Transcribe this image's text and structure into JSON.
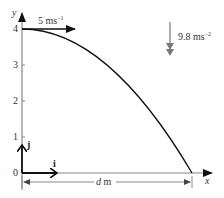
{
  "diagram": {
    "type": "projectile-trajectory",
    "axes": {
      "x_label": "x",
      "y_label": "y",
      "y_ticks": [
        "0",
        "1",
        "2",
        "3",
        "4"
      ]
    },
    "unit_vectors": {
      "i_label": "i",
      "j_label": "j"
    },
    "initial_velocity": {
      "value": "5 ms",
      "exponent": "−1"
    },
    "gravity": {
      "value": "9.8 ms",
      "exponent": "−2"
    },
    "distance": {
      "label_var": "d",
      "label_unit": " m"
    },
    "colors": {
      "axis": "#888888",
      "curve": "#111111",
      "arrow": "#111111",
      "gravity_arrow": "#777777",
      "text": "#333333"
    }
  }
}
